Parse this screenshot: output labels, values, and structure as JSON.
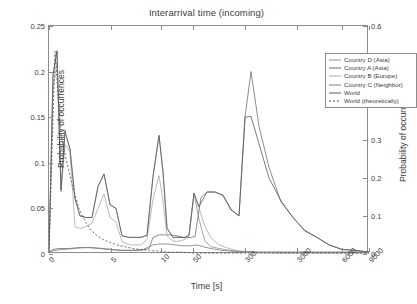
{
  "chart_data": {
    "type": "line",
    "title": "Interarrival time (incoming)",
    "xlabel": "Time [s]",
    "ylabel": "Probability of occurrences",
    "ylabel_right": "Probability of occurrences (world)",
    "grid": false,
    "legend_position": "top-right",
    "xticks": [
      {
        "label": "0",
        "pos": 0
      },
      {
        "label": "5",
        "pos": 62
      },
      {
        "label": "10",
        "pos": 112
      },
      {
        "label": "50",
        "pos": 144
      },
      {
        "label": "300",
        "pos": 196
      },
      {
        "label": "3000",
        "pos": 248
      },
      {
        "label": "6000",
        "pos": 293
      },
      {
        "label": "9000",
        "pos": 320
      }
    ],
    "yticks_left": [
      "0",
      "0.05",
      "0.1",
      "0.15",
      "0.2",
      "0.25"
    ],
    "ylim_left": [
      0,
      0.25
    ],
    "yticks_right": [
      "0",
      "0.1",
      "0.2",
      "0.3",
      "0.4",
      "0.5",
      "0.6"
    ],
    "ylim_right": [
      0,
      0.6
    ],
    "series": [
      {
        "name": "Country D (Asia)",
        "color": "#8f8f8f",
        "dash": "none",
        "axis": "left",
        "points": [
          [
            0,
            0.001
          ],
          [
            4,
            0.197
          ],
          [
            8,
            0.222
          ],
          [
            12,
            0.07
          ],
          [
            16,
            0.134
          ],
          [
            21,
            0.115
          ],
          [
            26,
            0.061
          ],
          [
            31,
            0.042
          ],
          [
            37,
            0.04
          ],
          [
            43,
            0.04
          ],
          [
            49,
            0.074
          ],
          [
            55,
            0.088
          ],
          [
            61,
            0.054
          ],
          [
            67,
            0.05
          ],
          [
            73,
            0.02
          ],
          [
            80,
            0.018
          ],
          [
            86,
            0.018
          ],
          [
            92,
            0.018
          ],
          [
            98,
            0.02
          ],
          [
            104,
            0.085
          ],
          [
            110,
            0.13
          ],
          [
            114,
            0.09
          ],
          [
            118,
            0.028
          ],
          [
            124,
            0.018
          ],
          [
            130,
            0.018
          ],
          [
            136,
            0.018
          ],
          [
            140,
            0.02
          ],
          [
            145,
            0.067
          ],
          [
            150,
            0.038
          ],
          [
            156,
            0.014
          ],
          [
            162,
            0.008
          ],
          [
            170,
            0.006
          ],
          [
            180,
            0.004
          ],
          [
            190,
            0.003
          ],
          [
            200,
            0.002
          ],
          [
            220,
            0.002
          ],
          [
            250,
            0.002
          ],
          [
            280,
            0.002
          ],
          [
            320,
            0.002
          ]
        ]
      },
      {
        "name": "Country A (Asia)",
        "color": "#6e6e6e",
        "dash": "none",
        "axis": "left",
        "points": [
          [
            0,
            0.002
          ],
          [
            4,
            0.005
          ],
          [
            10,
            0.006
          ],
          [
            20,
            0.006
          ],
          [
            30,
            0.007
          ],
          [
            40,
            0.007
          ],
          [
            50,
            0.006
          ],
          [
            60,
            0.005
          ],
          [
            70,
            0.004
          ],
          [
            80,
            0.004
          ],
          [
            92,
            0.004
          ],
          [
            100,
            0.006
          ],
          [
            104,
            0.018
          ],
          [
            110,
            0.021
          ],
          [
            116,
            0.021
          ],
          [
            122,
            0.021
          ],
          [
            128,
            0.02
          ],
          [
            134,
            0.018
          ],
          [
            140,
            0.018
          ],
          [
            146,
            0.019
          ],
          [
            152,
            0.062
          ],
          [
            158,
            0.068
          ],
          [
            166,
            0.068
          ],
          [
            174,
            0.064
          ],
          [
            182,
            0.048
          ],
          [
            190,
            0.042
          ],
          [
            196,
            0.15
          ],
          [
            202,
            0.2
          ],
          [
            210,
            0.14
          ],
          [
            220,
            0.095
          ],
          [
            232,
            0.057
          ],
          [
            244,
            0.04
          ],
          [
            256,
            0.025
          ],
          [
            268,
            0.018
          ],
          [
            280,
            0.01
          ],
          [
            293,
            0.005
          ],
          [
            306,
            0.004
          ],
          [
            320,
            0.002
          ]
        ]
      },
      {
        "name": "Country B (Europe)",
        "color": "#a8a8a8",
        "dash": "none",
        "axis": "left",
        "points": [
          [
            0,
            0.001
          ],
          [
            4,
            0.18
          ],
          [
            8,
            0.21
          ],
          [
            12,
            0.068
          ],
          [
            16,
            0.12
          ],
          [
            21,
            0.112
          ],
          [
            26,
            0.03
          ],
          [
            31,
            0.028
          ],
          [
            37,
            0.03
          ],
          [
            43,
            0.034
          ],
          [
            49,
            0.05
          ],
          [
            55,
            0.066
          ],
          [
            61,
            0.04
          ],
          [
            67,
            0.035
          ],
          [
            73,
            0.014
          ],
          [
            80,
            0.01
          ],
          [
            86,
            0.01
          ],
          [
            92,
            0.01
          ],
          [
            98,
            0.016
          ],
          [
            104,
            0.06
          ],
          [
            110,
            0.086
          ],
          [
            114,
            0.058
          ],
          [
            118,
            0.02
          ],
          [
            124,
            0.014
          ],
          [
            130,
            0.014
          ],
          [
            136,
            0.016
          ],
          [
            140,
            0.02
          ],
          [
            145,
            0.066
          ],
          [
            150,
            0.05
          ],
          [
            156,
            0.03
          ],
          [
            162,
            0.018
          ],
          [
            170,
            0.01
          ],
          [
            180,
            0.006
          ],
          [
            190,
            0.003
          ],
          [
            200,
            0.002
          ],
          [
            230,
            0.001
          ],
          [
            270,
            0.001
          ],
          [
            320,
            0.001
          ]
        ]
      },
      {
        "name": "Country C (Neighbor)",
        "color": "#7d7d7d",
        "dash": "none",
        "axis": "left",
        "points": [
          [
            0,
            0.002
          ],
          [
            6,
            0.004
          ],
          [
            14,
            0.005
          ],
          [
            24,
            0.006
          ],
          [
            34,
            0.007
          ],
          [
            44,
            0.007
          ],
          [
            54,
            0.006
          ],
          [
            64,
            0.005
          ],
          [
            74,
            0.004
          ],
          [
            84,
            0.004
          ],
          [
            94,
            0.005
          ],
          [
            104,
            0.01
          ],
          [
            110,
            0.011
          ],
          [
            118,
            0.011
          ],
          [
            126,
            0.01
          ],
          [
            134,
            0.009
          ],
          [
            142,
            0.009
          ],
          [
            148,
            0.01
          ],
          [
            154,
            0.008
          ],
          [
            162,
            0.006
          ],
          [
            172,
            0.004
          ],
          [
            184,
            0.003
          ],
          [
            196,
            0.003
          ],
          [
            210,
            0.002
          ],
          [
            230,
            0.002
          ],
          [
            260,
            0.002
          ],
          [
            290,
            0.002
          ],
          [
            320,
            0.002
          ]
        ]
      },
      {
        "name": "World",
        "color": "#5a5a5a",
        "dash": "none",
        "axis": "right",
        "points": [
          [
            0,
            0.004
          ],
          [
            4,
            0.47
          ],
          [
            8,
            0.535
          ],
          [
            12,
            0.168
          ],
          [
            16,
            0.322
          ],
          [
            21,
            0.276
          ],
          [
            26,
            0.146
          ],
          [
            31,
            0.1
          ],
          [
            37,
            0.096
          ],
          [
            43,
            0.096
          ],
          [
            49,
            0.178
          ],
          [
            55,
            0.21
          ],
          [
            61,
            0.13
          ],
          [
            67,
            0.12
          ],
          [
            73,
            0.048
          ],
          [
            80,
            0.044
          ],
          [
            86,
            0.044
          ],
          [
            92,
            0.044
          ],
          [
            98,
            0.05
          ],
          [
            104,
            0.204
          ],
          [
            110,
            0.312
          ],
          [
            114,
            0.216
          ],
          [
            118,
            0.068
          ],
          [
            124,
            0.044
          ],
          [
            130,
            0.044
          ],
          [
            136,
            0.044
          ],
          [
            140,
            0.05
          ],
          [
            145,
            0.16
          ],
          [
            150,
            0.125
          ],
          [
            158,
            0.163
          ],
          [
            166,
            0.163
          ],
          [
            174,
            0.155
          ],
          [
            182,
            0.118
          ],
          [
            190,
            0.1
          ],
          [
            196,
            0.36
          ],
          [
            202,
            0.362
          ],
          [
            210,
            0.29
          ],
          [
            220,
            0.2
          ],
          [
            232,
            0.14
          ],
          [
            244,
            0.096
          ],
          [
            256,
            0.062
          ],
          [
            268,
            0.044
          ],
          [
            280,
            0.024
          ],
          [
            293,
            0.012
          ],
          [
            306,
            0.01
          ],
          [
            320,
            0.005
          ]
        ]
      },
      {
        "name": "World (theoretically)",
        "color": "#4a4a4a",
        "dash": "2,2",
        "axis": "left",
        "points": [
          [
            0,
            0.001
          ],
          [
            6,
            0.222
          ],
          [
            12,
            0.13
          ],
          [
            18,
            0.1
          ],
          [
            24,
            0.072
          ],
          [
            30,
            0.05
          ],
          [
            36,
            0.036
          ],
          [
            42,
            0.026
          ],
          [
            48,
            0.02
          ],
          [
            54,
            0.016
          ],
          [
            60,
            0.013
          ],
          [
            68,
            0.01
          ],
          [
            76,
            0.008
          ],
          [
            84,
            0.006
          ],
          [
            92,
            0.005
          ],
          [
            100,
            0.004
          ],
          [
            110,
            0.003
          ],
          [
            120,
            0.002
          ],
          [
            132,
            0.002
          ],
          [
            146,
            0.001
          ],
          [
            160,
            0.001
          ],
          [
            180,
            0.001
          ],
          [
            210,
            0.001
          ],
          [
            250,
            0.001
          ],
          [
            290,
            0.001
          ],
          [
            320,
            0.001
          ]
        ]
      }
    ]
  }
}
